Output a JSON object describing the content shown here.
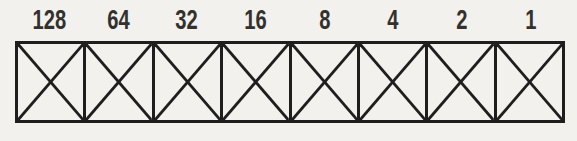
{
  "diagram": {
    "labels": [
      "128",
      "64",
      "32",
      "16",
      "8",
      "4",
      "2",
      "1"
    ],
    "cells": [
      {
        "label": "128",
        "mark": "X"
      },
      {
        "label": "64",
        "mark": "X"
      },
      {
        "label": "32",
        "mark": "X"
      },
      {
        "label": "16",
        "mark": "X"
      },
      {
        "label": "8",
        "mark": "X"
      },
      {
        "label": "4",
        "mark": "X"
      },
      {
        "label": "2",
        "mark": "X"
      },
      {
        "label": "1",
        "mark": "X"
      }
    ],
    "cell_count": 8,
    "colors": {
      "ink": "#1f1e1c",
      "text": "#33312e",
      "paper": "#f2f1ee"
    }
  }
}
